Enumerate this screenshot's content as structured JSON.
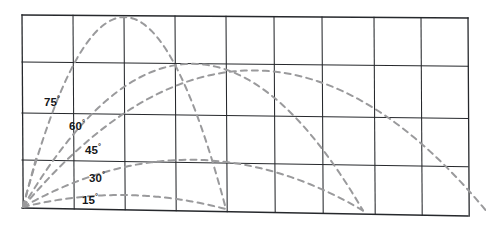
{
  "figure": {
    "name": "projectile-trajectory-diagram",
    "background": "#ffffff",
    "grid_color": "#26282c",
    "curve_color": "#9a9a9c",
    "label_color": "#16171a"
  },
  "grid": {
    "columns": 8,
    "rows": 4,
    "x_lines": [
      22,
      73,
      124,
      175,
      226,
      274,
      322,
      374,
      421,
      468
    ],
    "y_lines": [
      15,
      62,
      113,
      160,
      208
    ],
    "visible": true
  },
  "labels": [
    {
      "id": "label-75",
      "text": "75",
      "degree": "°",
      "x": 44,
      "y": 94
    },
    {
      "id": "label-60",
      "text": "60",
      "degree": "°",
      "x": 69,
      "y": 118
    },
    {
      "id": "label-45",
      "text": "45",
      "degree": "°",
      "x": 85,
      "y": 142
    },
    {
      "id": "label-30",
      "text": "30",
      "degree": "°",
      "x": 89,
      "y": 170
    },
    {
      "id": "label-15",
      "text": "15",
      "degree": "°",
      "x": 82,
      "y": 192
    }
  ],
  "chart_data": {
    "type": "line",
    "title": "",
    "subtitle": "",
    "xlabel": "",
    "ylabel": "",
    "xlim": [
      0,
      486
    ],
    "ylim": [
      0,
      226
    ],
    "grid": true,
    "legend_position": "inline-annotations",
    "origin": {
      "x": 23,
      "y": 207
    },
    "annotations": [
      "75°",
      "60°",
      "45°",
      "30°",
      "15°"
    ],
    "series": [
      {
        "name": "75°",
        "angle_deg": 75,
        "style": "dashed",
        "color": "#9a9a9c",
        "launch_x": 23,
        "launch_y": 207,
        "peak_x": 124,
        "peak_y": 16,
        "range_x": 226,
        "land_y": 208,
        "relative_range": 0.5,
        "relative_height": 0.93
      },
      {
        "name": "60°",
        "angle_deg": 60,
        "style": "dashed",
        "color": "#9a9a9c",
        "launch_x": 23,
        "launch_y": 207,
        "peak_x": 193,
        "peak_y": 62,
        "range_x": 363,
        "land_y": 208,
        "relative_range": 0.87,
        "relative_height": 0.75
      },
      {
        "name": "45°",
        "angle_deg": 45,
        "style": "dashed",
        "color": "#9a9a9c",
        "launch_x": 23,
        "launch_y": 207,
        "peak_x": 255,
        "peak_y": 68,
        "range_x": 487,
        "land_y": 226,
        "relative_range": 1.0,
        "relative_height": 0.5
      },
      {
        "name": "30°",
        "angle_deg": 30,
        "style": "dashed",
        "color": "#9a9a9c",
        "launch_x": 23,
        "launch_y": 207,
        "peak_x": 193,
        "peak_y": 158,
        "range_x": 363,
        "land_y": 208,
        "relative_range": 0.87,
        "relative_height": 0.25
      },
      {
        "name": "15°",
        "angle_deg": 15,
        "style": "dashed",
        "color": "#9a9a9c",
        "launch_x": 23,
        "launch_y": 207,
        "peak_x": 124,
        "peak_y": 194,
        "range_x": 226,
        "land_y": 208,
        "relative_range": 0.5,
        "relative_height": 0.07
      }
    ]
  }
}
